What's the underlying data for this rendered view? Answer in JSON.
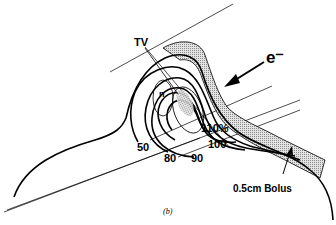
{
  "diagram": {
    "labels": {
      "target_volume": "TV",
      "electron": "e⁻",
      "isodose_110": "110%",
      "isodose_100": "100",
      "isodose_90": "90",
      "isodose_80": "80",
      "isodose_50": "50",
      "bolus": "0.5cm Bolus",
      "nose_marker": "n"
    },
    "caption": "(b)",
    "colors": {
      "line": "#000000",
      "bolus_fill": "#c8c8c8",
      "hotspot_fill": "#9a9a9a"
    }
  }
}
